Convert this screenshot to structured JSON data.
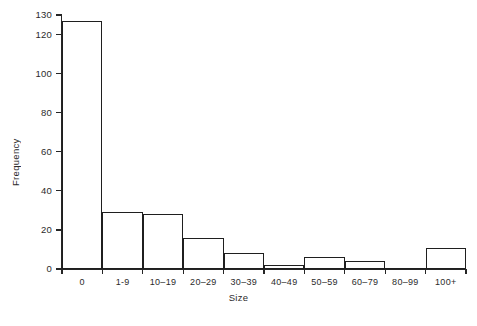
{
  "chart_data": {
    "type": "bar",
    "title": "",
    "subtitle": "",
    "xlabel": "Size",
    "ylabel": "Frequency",
    "categories": [
      "0",
      "1-9",
      "10–19",
      "20–29",
      "30–39",
      "40–49",
      "50–59",
      "60–79",
      "80–99",
      "100+"
    ],
    "values": [
      127,
      29,
      28,
      16,
      8,
      2,
      6,
      4,
      0,
      11
    ],
    "series": [
      {
        "name": "Frequency",
        "values": [
          127,
          29,
          28,
          16,
          8,
          2,
          6,
          4,
          0,
          11
        ]
      }
    ],
    "ylim": [
      0,
      130
    ],
    "yticks": [
      0,
      20,
      40,
      60,
      80,
      100,
      120,
      130
    ],
    "ytick_labels": [
      "0",
      "20",
      "40",
      "60",
      "80",
      "100",
      "120",
      "130"
    ],
    "xtick_labels": [
      "0",
      "1-9",
      "10–19",
      "20–29",
      "30–39",
      "40–49",
      "50–59",
      "60–79",
      "80–99",
      "100+"
    ],
    "grid": false,
    "legend": null,
    "bar_style": {
      "fill": "#ffffff",
      "stroke": "#1f1f1f",
      "gap": 0
    },
    "axis_color": "#262626",
    "background": "#ffffff",
    "annotations": []
  }
}
